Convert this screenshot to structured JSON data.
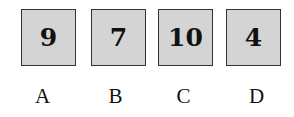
{
  "cards": [
    {
      "value": "9",
      "label": "A"
    },
    {
      "value": "7",
      "label": "B"
    },
    {
      "value": "10",
      "label": "C"
    },
    {
      "value": "4",
      "label": "D"
    }
  ]
}
